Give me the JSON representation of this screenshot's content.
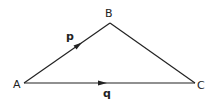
{
  "diagram": {
    "type": "vector-triangle",
    "vertices": [
      {
        "id": "A",
        "label": "A",
        "x": 24,
        "y": 83
      },
      {
        "id": "B",
        "label": "B",
        "x": 110,
        "y": 23
      },
      {
        "id": "C",
        "label": "C",
        "x": 195,
        "y": 83
      }
    ],
    "edges": [
      {
        "from": "A",
        "to": "B",
        "vector_label": "p",
        "arrow": true
      },
      {
        "from": "A",
        "to": "C",
        "vector_label": "q",
        "arrow": true
      },
      {
        "from": "B",
        "to": "C",
        "arrow": false
      }
    ],
    "labels": {
      "A": "A",
      "B": "B",
      "C": "C",
      "p": "p",
      "q": "q"
    },
    "colors": {
      "line": "#222222",
      "background": "#ffffff"
    }
  }
}
